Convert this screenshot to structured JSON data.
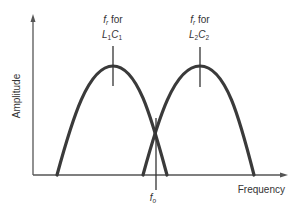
{
  "diagram": {
    "y_axis_label": "Amplitude",
    "x_axis_label": "Frequency",
    "curves": [
      {
        "name": "L1C1 response",
        "peak_label_prefix": "f",
        "peak_label_sub": "r",
        "peak_label_for": " for",
        "component_label": {
          "l": "L",
          "l_sub": "1",
          "c": "C",
          "c_sub": "1"
        }
      },
      {
        "name": "L2C2 response",
        "peak_label_prefix": "f",
        "peak_label_sub": "r",
        "peak_label_for": " for",
        "component_label": {
          "l": "L",
          "l_sub": "2",
          "c": "C",
          "c_sub": "2"
        }
      }
    ],
    "crossover_label": {
      "main": "f",
      "sub": "o"
    },
    "colors": {
      "curve": "#3a3a3a",
      "axis": "#555555",
      "text": "#333333"
    }
  }
}
